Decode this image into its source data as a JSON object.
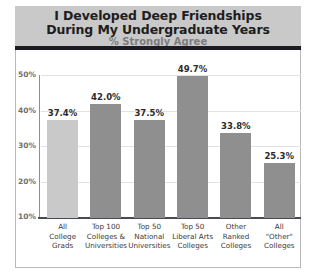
{
  "chart_data": {
    "type": "bar",
    "title": "I Developed Deep Friendships During My Undergraduate Years",
    "title_line1": "I Developed Deep Friendships",
    "title_line2": "During My Undergraduate Years",
    "subtitle": "% Strongly Agree",
    "xlabel": "",
    "ylabel": "",
    "ylim": [
      10,
      50
    ],
    "yticks": [
      "50%",
      "40%",
      "30%",
      "20%",
      "10%"
    ],
    "ytick_values": [
      50,
      40,
      30,
      20,
      10
    ],
    "grid": true,
    "legend": "none",
    "categories": [
      "All College Grads",
      "Top 100 Colleges & Universities",
      "Top 50 National Universities",
      "Top 50 Liberal Arts Colleges",
      "Other Ranked Colleges",
      "All \"Other\" Colleges"
    ],
    "category_lines": [
      [
        "All",
        "College",
        "Grads"
      ],
      [
        "Top 100",
        "Colleges &",
        "Universities"
      ],
      [
        "Top 50",
        "National",
        "Universities"
      ],
      [
        "Top 50",
        "Liberal Arts",
        "Colleges"
      ],
      [
        "Other",
        "Ranked",
        "Colleges"
      ],
      [
        "All",
        "\"Other\"",
        "Colleges"
      ]
    ],
    "values": [
      37.4,
      42.0,
      37.5,
      49.7,
      33.8,
      25.3
    ],
    "value_labels": [
      "37.4%",
      "42.0%",
      "37.5%",
      "49.7%",
      "33.8%",
      "25.3%"
    ],
    "bar_colors": [
      "#c9c9c9",
      "#8f8f8f",
      "#8f8f8f",
      "#8f8f8f",
      "#8f8f8f",
      "#8f8f8f"
    ],
    "highlight_index": 0
  },
  "colors": {
    "header_band": "#c9c9c9",
    "header_rule": "#1b1b23",
    "title_text": "#1d1d1d",
    "subtitle_text": "#7d7d7d",
    "bar_default": "#8f8f8f",
    "bar_highlight": "#c9c9c9",
    "gridline": "#e2e2e2",
    "axis": "#4a4a52",
    "frame_border": "#b9b9b9",
    "tick_text": "#6f6f6f",
    "value_text": "#2b2b2b",
    "category_text": "#3a3a3a",
    "background": "#ffffff"
  }
}
